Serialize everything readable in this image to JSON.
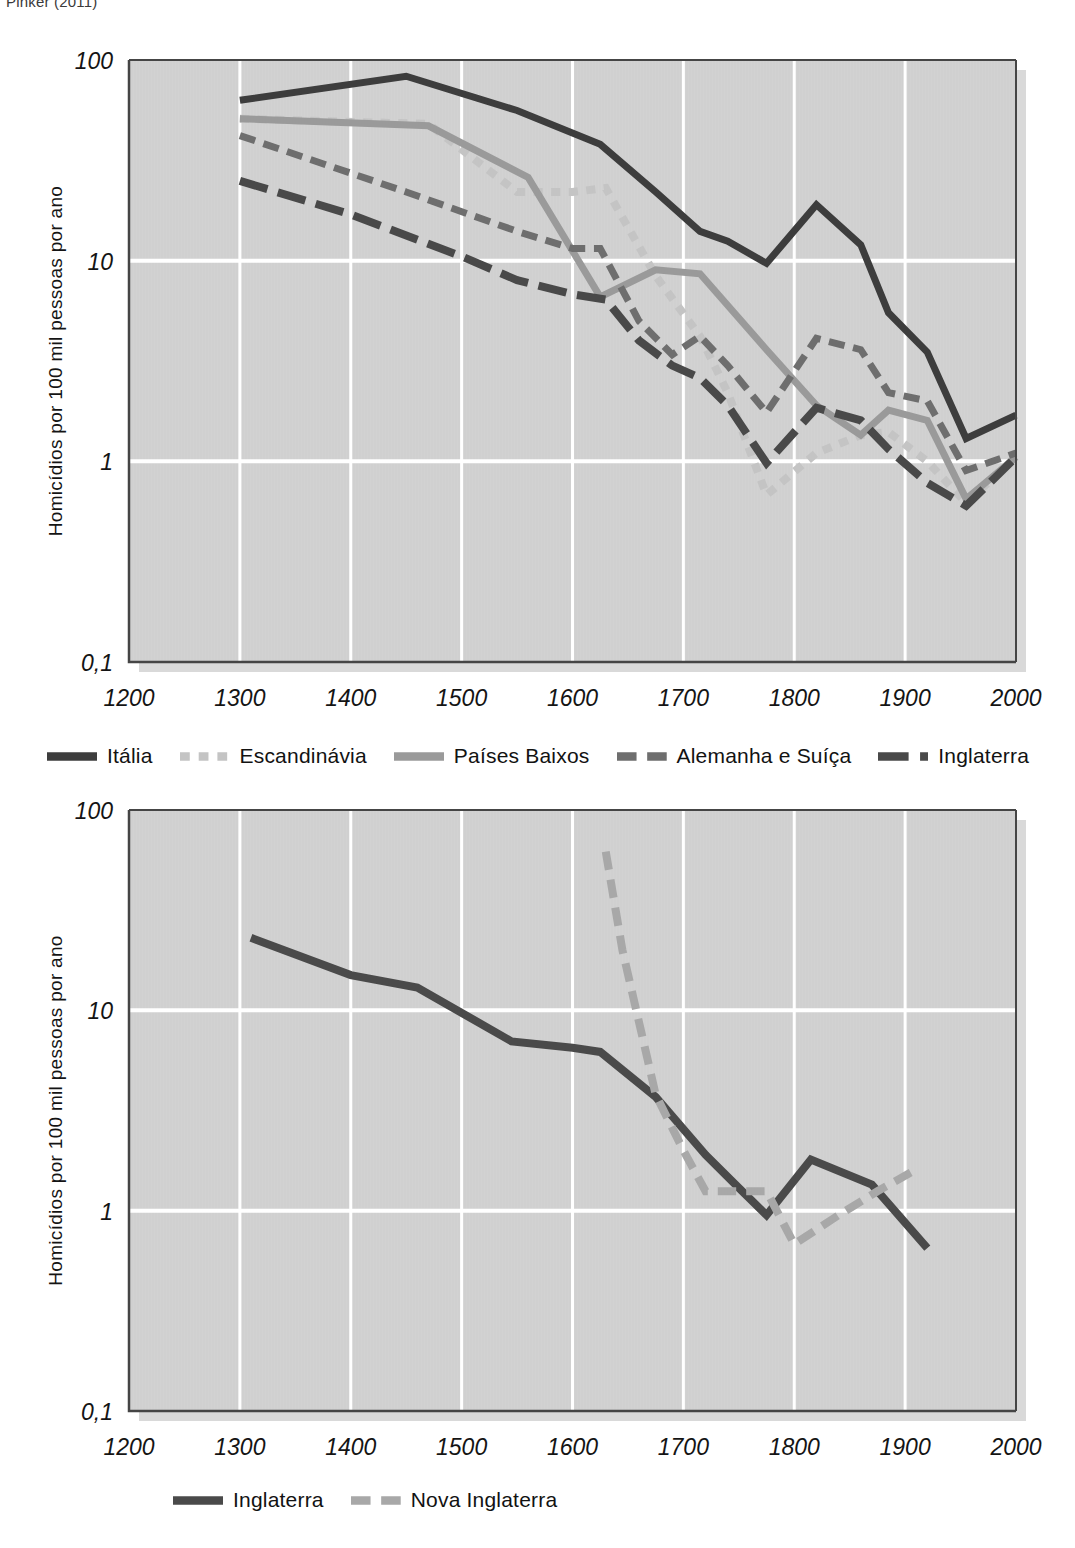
{
  "source_credit": "Pinker (2011)",
  "figures": [
    {
      "id": "figure-1",
      "ylabel": "Homicídios por 100 mil pessoas por ano",
      "legend": [
        {
          "label": "Itália",
          "color": "#3d3d3d",
          "dash": "solid"
        },
        {
          "label": "Escandinávia",
          "color": "#c4c4c4",
          "dash": "dotted"
        },
        {
          "label": "Países Baixos",
          "color": "#9a9a9a",
          "dash": "solid"
        },
        {
          "label": "Alemanha e Suíça",
          "color": "#6e6e6e",
          "dash": "dashed"
        },
        {
          "label": "Inglaterra",
          "color": "#494949",
          "dash": "longdash"
        }
      ]
    },
    {
      "id": "figure-2",
      "ylabel": "Homicídios por 100 mil pessoas por ano",
      "legend": [
        {
          "label": "Inglaterra",
          "color": "#4a4a4a",
          "dash": "solid"
        },
        {
          "label": "Nova Inglaterra",
          "color": "#a8a8a8",
          "dash": "dashed"
        }
      ]
    }
  ],
  "chart_data": [
    {
      "type": "line",
      "title": "",
      "xlabel": "",
      "ylabel": "Homicídios por 100 mil pessoas por ano",
      "yscale": "log",
      "xlim": [
        1200,
        2000
      ],
      "ylim": [
        0.1,
        100
      ],
      "xticks": [
        1200,
        1300,
        1400,
        1500,
        1600,
        1700,
        1800,
        1900,
        2000
      ],
      "xticklabels": [
        "1200",
        "1300",
        "1400",
        "1500",
        "1600",
        "1700",
        "1800",
        "1900",
        "2000"
      ],
      "yticks": [
        0.1,
        1,
        10,
        100
      ],
      "yticklabels": [
        "0,1",
        "1",
        "10",
        "100"
      ],
      "grid": true,
      "grid_color": "#ffffff",
      "plot_bgcolor": "#d2d2d2",
      "legend_position": "below",
      "series": [
        {
          "name": "Itália",
          "color": "#3d3d3d",
          "dash": "solid",
          "width": 7,
          "x": [
            1300,
            1450,
            1550,
            1625,
            1675,
            1715,
            1740,
            1775,
            1820,
            1860,
            1885,
            1920,
            1955,
            2000
          ],
          "y": [
            63,
            83,
            56,
            38,
            22,
            14,
            12.5,
            9.7,
            19,
            12,
            5.5,
            3.5,
            1.3,
            1.7
          ]
        },
        {
          "name": "Escandinávia",
          "color": "#c4c4c4",
          "dash": "dotted",
          "width": 8,
          "x": [
            1300,
            1470,
            1550,
            1600,
            1630,
            1675,
            1715,
            1740,
            1775,
            1820,
            1860,
            1885,
            1920,
            1955,
            2000
          ],
          "y": [
            51,
            48,
            22,
            22,
            23,
            8.4,
            4.2,
            2.2,
            0.68,
            1.1,
            1.35,
            1.4,
            1.0,
            0.62,
            1.05
          ]
        },
        {
          "name": "Países Baixos",
          "color": "#9a9a9a",
          "dash": "solid",
          "width": 7,
          "x": [
            1300,
            1470,
            1560,
            1625,
            1675,
            1715,
            1775,
            1820,
            1860,
            1885,
            1920,
            1955,
            2000
          ],
          "y": [
            51,
            47,
            26,
            6.6,
            9.0,
            8.6,
            3.6,
            1.9,
            1.35,
            1.8,
            1.6,
            0.65,
            1.05
          ]
        },
        {
          "name": "Alemanha e Suíça",
          "color": "#6e6e6e",
          "dash": "dashed",
          "width": 7,
          "x": [
            1300,
            1450,
            1550,
            1600,
            1625,
            1660,
            1690,
            1715,
            1740,
            1775,
            1820,
            1860,
            1885,
            1920,
            1955,
            2000
          ],
          "y": [
            42,
            22,
            14,
            11.5,
            11.5,
            5.0,
            3.4,
            4.2,
            3.0,
            1.75,
            4.1,
            3.6,
            2.2,
            2.0,
            0.9,
            1.1
          ]
        },
        {
          "name": "Inglaterra",
          "color": "#494949",
          "dash": "longdash",
          "width": 8,
          "x": [
            1300,
            1400,
            1500,
            1550,
            1600,
            1630,
            1660,
            1690,
            1715,
            1740,
            1775,
            1820,
            1860,
            1885,
            1920,
            1955,
            2000
          ],
          "y": [
            25,
            17,
            10.5,
            8.0,
            6.8,
            6.4,
            4.0,
            3.0,
            2.6,
            1.9,
            0.98,
            1.85,
            1.6,
            1.15,
            0.78,
            0.6,
            1.05
          ]
        }
      ]
    },
    {
      "type": "line",
      "title": "",
      "xlabel": "",
      "ylabel": "Homicídios por 100 mil pessoas por ano",
      "yscale": "log",
      "xlim": [
        1200,
        2000
      ],
      "ylim": [
        0.1,
        100
      ],
      "xticks": [
        1200,
        1300,
        1400,
        1500,
        1600,
        1700,
        1800,
        1900,
        2000
      ],
      "xticklabels": [
        "1200",
        "1300",
        "1400",
        "1500",
        "1600",
        "1700",
        "1800",
        "1900",
        "2000"
      ],
      "yticks": [
        0.1,
        1,
        10,
        100
      ],
      "yticklabels": [
        "0,1",
        "1",
        "10",
        "100"
      ],
      "grid": true,
      "grid_color": "#ffffff",
      "plot_bgcolor": "#d2d2d2",
      "legend_position": "below",
      "series": [
        {
          "name": "Inglaterra",
          "color": "#4a4a4a",
          "dash": "solid",
          "width": 8,
          "x": [
            1310,
            1400,
            1460,
            1545,
            1600,
            1625,
            1675,
            1720,
            1750,
            1775,
            1815,
            1870,
            1920
          ],
          "y": [
            23,
            15,
            13,
            7.0,
            6.5,
            6.2,
            3.7,
            1.9,
            1.3,
            0.95,
            1.8,
            1.35,
            0.65
          ]
        },
        {
          "name": "Nova Inglaterra",
          "color": "#a8a8a8",
          "dash": "dashed",
          "width": 8,
          "x": [
            1630,
            1645,
            1675,
            1700,
            1720,
            1750,
            1775,
            1800,
            1840,
            1875,
            1905
          ],
          "y": [
            62,
            20,
            3.8,
            2.0,
            1.25,
            1.25,
            1.25,
            0.68,
            0.95,
            1.25,
            1.55
          ]
        }
      ]
    }
  ]
}
